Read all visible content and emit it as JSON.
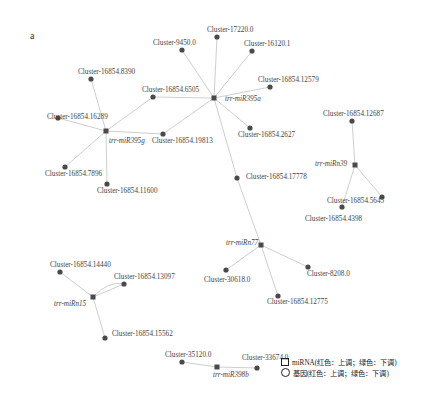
{
  "panel_label": "a",
  "colors": {
    "edge": "#c8c8c8",
    "node": "#4a4a4a",
    "text": "#444444"
  },
  "nodes": [
    {
      "id": "m395a",
      "label": "trr-miR395a",
      "type": "mirna",
      "x": 214,
      "y": 98,
      "lx": 225,
      "ly": 96
    },
    {
      "id": "m395g",
      "label": "trr-miR395g",
      "type": "mirna",
      "x": 106,
      "y": 131,
      "lx": 109,
      "ly": 138
    },
    {
      "id": "mn39",
      "label": "trr-miRn39",
      "type": "mirna",
      "x": 355,
      "y": 165,
      "lx": 315,
      "ly": 161
    },
    {
      "id": "mn77",
      "label": "trr-miRn77",
      "type": "mirna",
      "x": 261,
      "y": 245,
      "lx": 226,
      "ly": 240
    },
    {
      "id": "mn15",
      "label": "trr-miRn15",
      "type": "mirna",
      "x": 93,
      "y": 297,
      "lx": 54,
      "ly": 301
    },
    {
      "id": "m398b",
      "label": "trr-miR398b",
      "type": "mirna",
      "x": 217,
      "y": 367,
      "lx": 213,
      "ly": 372
    },
    {
      "id": "c17220",
      "label": "Cluster-17220.0",
      "type": "gene",
      "x": 217,
      "y": 37,
      "lx": 207,
      "ly": 27
    },
    {
      "id": "c9450",
      "label": "Cluster-9450.0",
      "type": "gene",
      "x": 182,
      "y": 50,
      "lx": 153,
      "ly": 40
    },
    {
      "id": "c16120",
      "label": "Cluster-16120.1",
      "type": "gene",
      "x": 252,
      "y": 51,
      "lx": 244,
      "ly": 41
    },
    {
      "id": "c8390",
      "label": "Cluster-16854.8390",
      "type": "gene",
      "x": 91,
      "y": 79,
      "lx": 78,
      "ly": 69
    },
    {
      "id": "c6505",
      "label": "Cluster-16854.6505",
      "type": "gene",
      "x": 153,
      "y": 97,
      "lx": 142,
      "ly": 87
    },
    {
      "id": "c12579",
      "label": "Cluster-16854.12579",
      "type": "gene",
      "x": 270,
      "y": 87,
      "lx": 258,
      "ly": 77
    },
    {
      "id": "c16289",
      "label": "Cluster-16854.16289",
      "type": "gene",
      "x": 58,
      "y": 118,
      "lx": 47,
      "ly": 114
    },
    {
      "id": "c19813",
      "label": "Cluster-16854.19813",
      "type": "gene",
      "x": 163,
      "y": 134,
      "lx": 152,
      "ly": 138
    },
    {
      "id": "c2627",
      "label": "Cluster-16854.2627",
      "type": "gene",
      "x": 250,
      "y": 128,
      "lx": 238,
      "ly": 132
    },
    {
      "id": "c7896",
      "label": "Cluster-16854.7896",
      "type": "gene",
      "x": 65,
      "y": 167,
      "lx": 45,
      "ly": 171
    },
    {
      "id": "c11600",
      "label": "Cluster-16854.11600",
      "type": "gene",
      "x": 107,
      "y": 184,
      "lx": 97,
      "ly": 188
    },
    {
      "id": "c12687",
      "label": "Cluster-16854.12687",
      "type": "gene",
      "x": 352,
      "y": 121,
      "lx": 323,
      "ly": 111
    },
    {
      "id": "c17778",
      "label": "Cluster-16854.17778",
      "type": "gene",
      "x": 237,
      "y": 178,
      "lx": 246,
      "ly": 174
    },
    {
      "id": "c5645",
      "label": "Cluster-16854.5645",
      "type": "gene",
      "x": 382,
      "y": 197,
      "lx": 327,
      "ly": 198
    },
    {
      "id": "c4398",
      "label": "Cluster-16854.4398",
      "type": "gene",
      "x": 342,
      "y": 207,
      "lx": 305,
      "ly": 216
    },
    {
      "id": "c8208",
      "label": "Cluster-8208.0",
      "type": "gene",
      "x": 308,
      "y": 267,
      "lx": 307,
      "ly": 271
    },
    {
      "id": "c30618",
      "label": "Cluster-30618.0",
      "type": "gene",
      "x": 226,
      "y": 270,
      "lx": 204,
      "ly": 277
    },
    {
      "id": "c12775",
      "label": "Cluster-16854.12775",
      "type": "gene",
      "x": 278,
      "y": 296,
      "lx": 267,
      "ly": 299
    },
    {
      "id": "c14440",
      "label": "Cluster-16854.14440",
      "type": "gene",
      "x": 60,
      "y": 272,
      "lx": 50,
      "ly": 262
    },
    {
      "id": "c13097",
      "label": "Cluster-16854.13097",
      "type": "gene",
      "x": 124,
      "y": 284,
      "lx": 114,
      "ly": 274
    },
    {
      "id": "c15562",
      "label": "Cluster-16854.15562",
      "type": "gene",
      "x": 105,
      "y": 338,
      "lx": 112,
      "ly": 331
    },
    {
      "id": "c35120",
      "label": "Cluster-35120.0",
      "type": "gene",
      "x": 182,
      "y": 362,
      "lx": 165,
      "ly": 352
    },
    {
      "id": "c33674",
      "label": "Cluster-33674.0",
      "type": "gene",
      "x": 257,
      "y": 368,
      "lx": 242,
      "ly": 355
    }
  ],
  "edges": [
    [
      "m395a",
      "c17220"
    ],
    [
      "m395a",
      "c9450"
    ],
    [
      "m395a",
      "c16120"
    ],
    [
      "m395a",
      "c6505"
    ],
    [
      "m395a",
      "c12579"
    ],
    [
      "m395a",
      "c19813"
    ],
    [
      "m395a",
      "c2627"
    ],
    [
      "m395a",
      "c17778"
    ],
    [
      "m395g",
      "c8390"
    ],
    [
      "m395g",
      "c16289"
    ],
    [
      "m395g",
      "c6505"
    ],
    [
      "m395g",
      "c19813"
    ],
    [
      "m395g",
      "c7896"
    ],
    [
      "m395g",
      "c11600"
    ],
    [
      "mn39",
      "c12687"
    ],
    [
      "mn39",
      "c5645"
    ],
    [
      "mn39",
      "c4398"
    ],
    [
      "mn77",
      "c17778"
    ],
    [
      "mn77",
      "c8208"
    ],
    [
      "mn77",
      "c30618"
    ],
    [
      "mn77",
      "c12775"
    ],
    [
      "mn15",
      "c14440"
    ],
    [
      "mn15",
      "c13097"
    ],
    [
      "mn15",
      "c15562"
    ],
    [
      "m398b",
      "c35120"
    ],
    [
      "m398b",
      "c33674"
    ]
  ],
  "curved_edges": [
    [
      "mn15",
      "c13097"
    ]
  ],
  "legend": {
    "mirna": "miRNA(红色：上调；绿色：下调)",
    "gene": "基因(红色：上调；绿色：下调)"
  }
}
